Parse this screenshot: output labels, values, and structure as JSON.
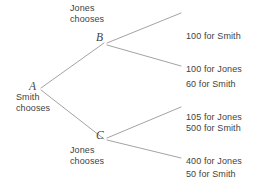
{
  "diagram": {
    "background_color": "#ffffff",
    "line_color": "#a3a3a3",
    "text_color": "#3f3f3f"
  },
  "nodes": {
    "a": {
      "letter": "A",
      "actor_line1": "Smith",
      "actor_line2": "chooses",
      "actor_label": "Smith\nchooses"
    },
    "b": {
      "letter": "B",
      "actor_line1": "Jones",
      "actor_line2": "chooses",
      "actor_label": "Jones\nchooses"
    },
    "c": {
      "letter": "C",
      "actor_line1": "Jones",
      "actor_line2": "chooses",
      "actor_label": "Jones\nchooses"
    }
  },
  "payoffs": [
    {
      "smith": "100 for Smith",
      "jones": "100 for Jones"
    },
    {
      "smith": "60 for Smith",
      "jones": "105 for Jones"
    },
    {
      "smith": "500 for Smith",
      "jones": "400 for Jones"
    },
    {
      "smith": "50 for Smith",
      "jones": "420 for Jones"
    }
  ]
}
